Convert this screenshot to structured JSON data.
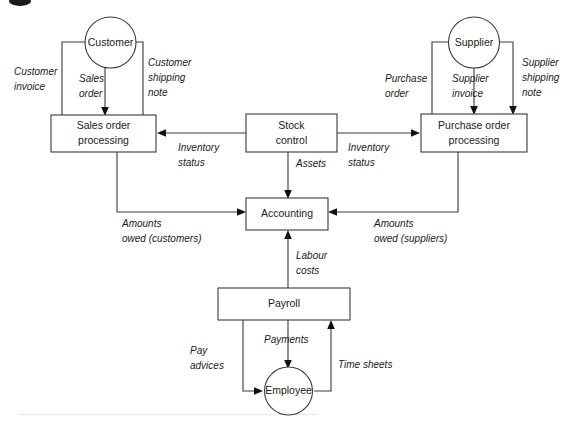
{
  "figure": {
    "type": "data-flow-diagram",
    "background_color": "#ffffff",
    "line_color": "#3a3a3a",
    "text_color": "#1a1a1a"
  },
  "processes": [
    {
      "id": "sales-order-processing",
      "label_line1": "Sales order",
      "label_line2": "processing",
      "shape": "rectangle"
    },
    {
      "id": "stock-control",
      "label_line1": "Stock",
      "label_line2": "control",
      "shape": "rectangle"
    },
    {
      "id": "purchase-order-processing",
      "label_line1": "Purchase order",
      "label_line2": "processing",
      "shape": "rectangle"
    },
    {
      "id": "accounting",
      "label_line1": "Accounting",
      "label_line2": "",
      "shape": "rectangle"
    },
    {
      "id": "payroll",
      "label_line1": "Payroll",
      "label_line2": "",
      "shape": "rectangle"
    }
  ],
  "entities": [
    {
      "id": "customer",
      "label": "Customer",
      "shape": "circle"
    },
    {
      "id": "supplier",
      "label": "Supplier",
      "shape": "circle"
    },
    {
      "id": "employee",
      "label": "Employee",
      "shape": "circle"
    }
  ],
  "flows": [
    {
      "id": "customer-invoice",
      "line1": "Customer",
      "line2": "invoice",
      "from": "sales-order-processing",
      "to": "customer"
    },
    {
      "id": "sales-order",
      "line1": "Sales",
      "line2": "order",
      "from": "customer",
      "to": "sales-order-processing"
    },
    {
      "id": "customer-shipping-note",
      "line1": "Customer",
      "line2": "shipping",
      "line3": "note",
      "from": "sales-order-processing",
      "to": "customer"
    },
    {
      "id": "purchase-order",
      "line1": "Purchase",
      "line2": "order",
      "from": "purchase-order-processing",
      "to": "supplier"
    },
    {
      "id": "supplier-invoice",
      "line1": "Supplier",
      "line2": "invoice",
      "from": "supplier",
      "to": "purchase-order-processing"
    },
    {
      "id": "supplier-shipping-note",
      "line1": "Supplier",
      "line2": "shipping",
      "line3": "note",
      "from": "supplier",
      "to": "purchase-order-processing"
    },
    {
      "id": "inventory-status-left",
      "line1": "Inventory",
      "line2": "status",
      "from": "stock-control",
      "to": "sales-order-processing"
    },
    {
      "id": "inventory-status-right",
      "line1": "Inventory",
      "line2": "status",
      "from": "stock-control",
      "to": "purchase-order-processing"
    },
    {
      "id": "assets",
      "line1": "Assets",
      "line2": "",
      "from": "stock-control",
      "to": "accounting"
    },
    {
      "id": "amounts-owed-customers",
      "line1": "Amounts",
      "line2": "owed (customers)",
      "from": "sales-order-processing",
      "to": "accounting"
    },
    {
      "id": "amounts-owed-suppliers",
      "line1": "Amounts",
      "line2": "owed (suppliers)",
      "from": "purchase-order-processing",
      "to": "accounting"
    },
    {
      "id": "labour-costs",
      "line1": "Labour",
      "line2": "costs",
      "from": "payroll",
      "to": "accounting"
    },
    {
      "id": "pay-advices",
      "line1": "Pay",
      "line2": "advices",
      "from": "payroll",
      "to": "employee"
    },
    {
      "id": "payments",
      "line1": "Payments",
      "line2": "",
      "from": "payroll",
      "to": "employee"
    },
    {
      "id": "time-sheets",
      "line1": "Time sheets",
      "line2": "",
      "from": "employee",
      "to": "payroll"
    }
  ]
}
